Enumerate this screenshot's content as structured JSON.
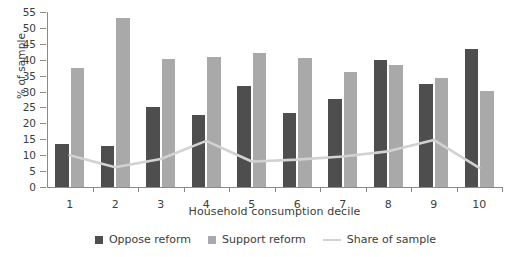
{
  "chart_data": {
    "type": "bar",
    "title": "",
    "xlabel": "Household consumption decile",
    "ylabel": "% of sample",
    "categories": [
      "1",
      "2",
      "3",
      "4",
      "5",
      "6",
      "7",
      "8",
      "9",
      "10"
    ],
    "ylim": [
      0,
      55
    ],
    "yticks": [
      0,
      5,
      10,
      15,
      20,
      25,
      30,
      35,
      40,
      45,
      50,
      55
    ],
    "grid": false,
    "legend_position": "bottom",
    "series": [
      {
        "name": "Oppose reform",
        "type": "bar",
        "color": "#4e4e4e",
        "values": [
          13.5,
          12.8,
          25.3,
          22.5,
          31.7,
          23.4,
          27.6,
          39.9,
          32.5,
          43.5
        ]
      },
      {
        "name": "Support reform",
        "type": "bar",
        "color": "#a9a9a9",
        "values": [
          37.4,
          53.1,
          40.3,
          40.8,
          42.0,
          40.5,
          36.0,
          38.3,
          34.2,
          30.2
        ]
      },
      {
        "name": "Share of sample",
        "type": "line",
        "color": "#d2d2d2",
        "values": [
          10.0,
          6.2,
          8.8,
          14.5,
          8.0,
          8.6,
          9.6,
          11.2,
          14.8,
          6.0
        ]
      }
    ]
  },
  "legend": {
    "items": [
      {
        "label": "Oppose reform",
        "marker": "square-swatch-dark"
      },
      {
        "label": "Support reform",
        "marker": "square-swatch-light"
      },
      {
        "label": "Share of sample",
        "marker": "line-swatch"
      }
    ]
  }
}
